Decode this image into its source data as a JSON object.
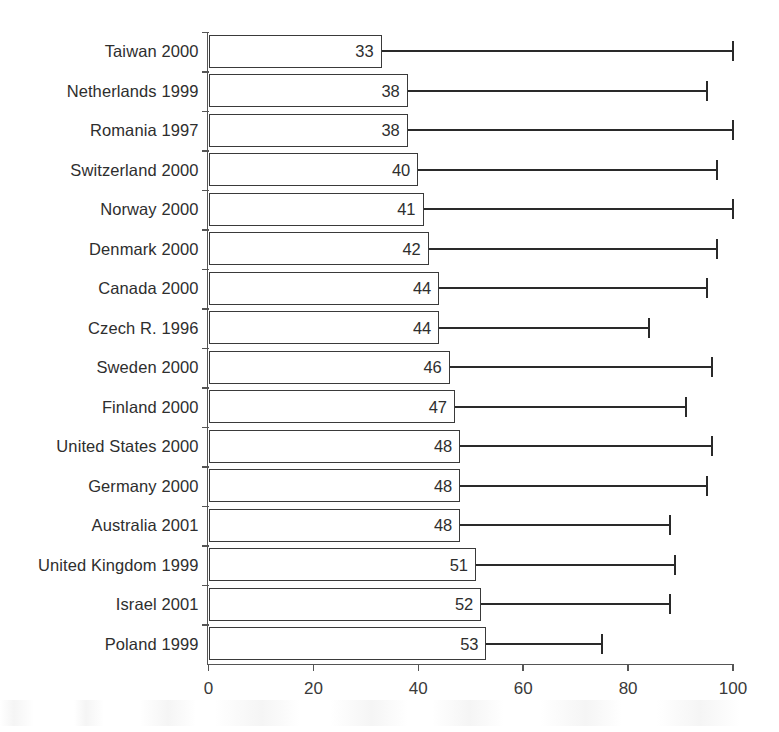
{
  "chart_data": {
    "type": "bar",
    "title": "",
    "subtitle": "",
    "xlabel": "",
    "ylabel": "",
    "orientation": "horizontal",
    "grid": false,
    "legend": null,
    "xlim": [
      0,
      100
    ],
    "xticks": [
      0,
      20,
      40,
      60,
      80,
      100
    ],
    "xtick_labels": [
      "0",
      "20",
      "40",
      "60",
      "80",
      "100"
    ],
    "categories": [
      "Taiwan 2000",
      "Netherlands 1999",
      "Romania 1997",
      "Switzerland 2000",
      "Norway 2000",
      "Denmark 2000",
      "Canada 2000",
      "Czech R. 1996",
      "Sweden 2000",
      "Finland 2000",
      "United States 2000",
      "Germany 2000",
      "Australia 2001",
      "United Kingdom 1999",
      "Israel 2001",
      "Poland 1999"
    ],
    "values": [
      33,
      38,
      38,
      40,
      41,
      42,
      44,
      44,
      46,
      47,
      48,
      48,
      48,
      51,
      52,
      53
    ],
    "value_labels": [
      "33",
      "38",
      "38",
      "40",
      "41",
      "42",
      "44",
      "44",
      "46",
      "47",
      "48",
      "48",
      "48",
      "51",
      "52",
      "53"
    ],
    "error_upper": [
      100,
      95,
      100,
      97,
      100,
      97,
      95,
      84,
      96,
      91,
      96,
      95,
      88,
      89,
      88,
      75
    ],
    "series": [
      {
        "name": "value",
        "values": [
          33,
          38,
          38,
          40,
          41,
          42,
          44,
          44,
          46,
          47,
          48,
          48,
          48,
          51,
          52,
          53
        ]
      },
      {
        "name": "range-upper",
        "values": [
          100,
          95,
          100,
          97,
          100,
          97,
          95,
          84,
          96,
          91,
          96,
          95,
          88,
          89,
          88,
          75
        ]
      }
    ],
    "colors": {
      "bar_fill": "#ffffff",
      "bar_stroke": "#3a3a3a",
      "whisker": "#2a2a2a",
      "axis": "#555555",
      "text": "#2e2e2e",
      "background": "#ffffff"
    }
  }
}
